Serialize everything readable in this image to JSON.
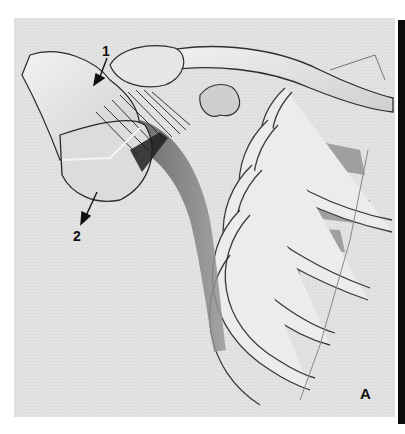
{
  "figure": {
    "panel_letter": "A",
    "callouts": [
      {
        "id": "1",
        "label": "1",
        "points_to": "superior humeral head / subacromial region"
      },
      {
        "id": "2",
        "label": "2",
        "points_to": "inferior humeral head"
      }
    ],
    "colors": {
      "background": "#e2e2e2",
      "bone_fill": "#ebebeb",
      "outline": "#2a2a2a",
      "shadow": "#7a7a7a",
      "edge_bar": "#0c0c0c"
    }
  }
}
